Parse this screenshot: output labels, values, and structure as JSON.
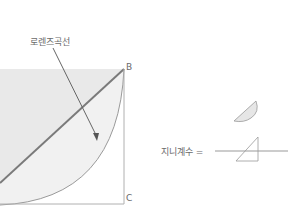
{
  "diagram": {
    "title_cut": "· · · · · · · · · · · ·",
    "curve_label": "로렌즈곡선",
    "point_b": "B",
    "point_c": "C",
    "formula_prefix": "지니계수 =",
    "colors": {
      "shade": "#e8e8e8",
      "lens": "#ededed",
      "line": "#888888",
      "equality_line": "#777777",
      "text": "#6a6a6a"
    }
  }
}
